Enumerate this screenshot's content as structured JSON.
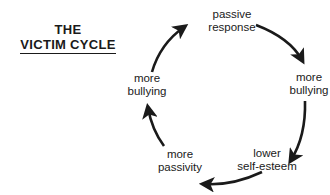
{
  "title": {
    "line1": "THE",
    "line2": "VICTIM CYCLE"
  },
  "nodes": [
    {
      "line1": "passive",
      "line2": "response"
    },
    {
      "line1": "more",
      "line2": "bullying"
    },
    {
      "line1": "lower",
      "line2": "self-esteem"
    },
    {
      "line1": "more",
      "line2": "passivity"
    },
    {
      "line1": "more",
      "line2": "bullying"
    }
  ],
  "colors": {
    "ink": "#1a1a1a",
    "background": "#ffffff"
  }
}
